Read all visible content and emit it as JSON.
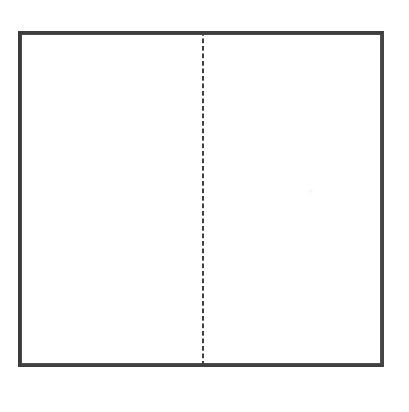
{
  "figure": {
    "kind": "line-drawing",
    "background_color": "#ffffff",
    "canvas": {
      "width": 409,
      "height": 412
    }
  },
  "frame": {
    "name": "outer-rectangle",
    "stroke_color": "#3d3d3d",
    "stroke_width_px": 4,
    "fill_color": "#ffffff",
    "left": 18,
    "top": 31,
    "width": 366,
    "height": 336
  },
  "divider": {
    "name": "vertical-dashed-fold-line",
    "orientation": "vertical",
    "style": "dashed",
    "stroke_color": "#3f3f3f",
    "stroke_width_px": 2,
    "dash_px": 5,
    "gap_px": 2.5,
    "x": 202,
    "top": 31,
    "bottom": 367
  },
  "panels": [
    {
      "name": "left-panel",
      "content": "",
      "fill_color": "#ffffff"
    },
    {
      "name": "right-panel",
      "content": "",
      "fill_color": "#ffffff"
    }
  ],
  "artifacts": [
    {
      "name": "scan-speck",
      "color": "#fafafa",
      "x": 309,
      "y": 189
    }
  ],
  "labels": {
    "title": "",
    "caption": "",
    "left_panel_label": "",
    "right_panel_label": ""
  }
}
